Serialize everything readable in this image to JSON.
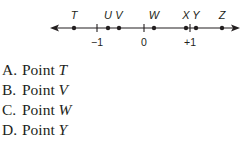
{
  "number_line": {
    "line_y": 28,
    "x_start": 50,
    "x_end": 240,
    "color": "#231f20",
    "points": [
      {
        "label": "T",
        "x": 74
      },
      {
        "label": "U",
        "x": 108
      },
      {
        "label": "V",
        "x": 119
      },
      {
        "label": "W",
        "x": 154
      },
      {
        "label": "X",
        "x": 186
      },
      {
        "label": "Y",
        "x": 196
      },
      {
        "label": "Z",
        "x": 222
      }
    ],
    "ticks": [
      {
        "label": "−1",
        "x": 97
      },
      {
        "label": "0",
        "x": 144
      },
      {
        "label": "+1",
        "x": 190
      }
    ]
  },
  "choices": [
    {
      "letter": "A.",
      "text": "Point ",
      "var": "T"
    },
    {
      "letter": "B.",
      "text": "Point ",
      "var": "V"
    },
    {
      "letter": "C.",
      "text": "Point ",
      "var": "W"
    },
    {
      "letter": "D.",
      "text": "Point ",
      "var": "Y"
    }
  ]
}
